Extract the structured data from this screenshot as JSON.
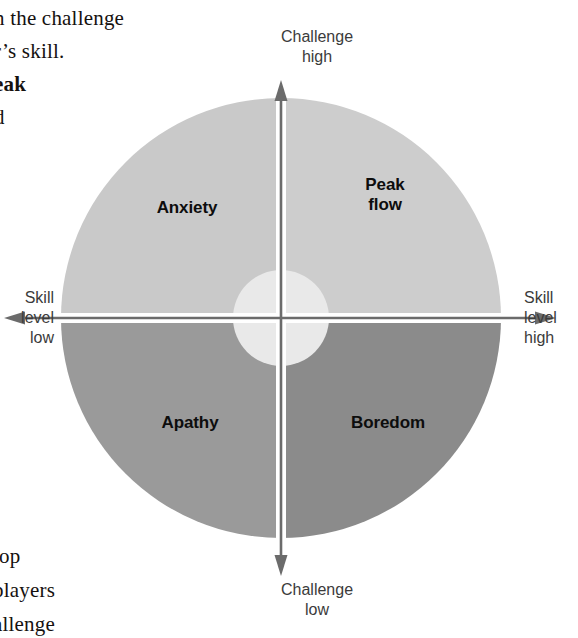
{
  "page": {
    "background_color": "#ffffff",
    "width": 578,
    "height": 638
  },
  "body_text": {
    "top_lines": [
      "n the challenge",
      "r’s  skill.",
      "eak",
      "d"
    ],
    "bottom_lines": [
      "l",
      "top",
      "players",
      "allenge"
    ]
  },
  "diagram": {
    "quadrants": [
      {
        "id": "anxiety",
        "label": "Anxiety",
        "position": "top-left",
        "color": "#c9c9c9"
      },
      {
        "id": "peak-flow",
        "label": "Peak\nflow",
        "label_line1": "Peak",
        "label_line2": "flow",
        "position": "top-right",
        "color": "#cdcdcd"
      },
      {
        "id": "apathy",
        "label": "Apathy",
        "position": "bottom-left",
        "color": "#9a9a9a"
      },
      {
        "id": "boredom",
        "label": "Boredom",
        "position": "bottom-right",
        "color": "#8b8b8b"
      }
    ],
    "center_circle": {
      "color": "#e9e9e9",
      "radius": 48
    },
    "axes": {
      "vertical": {
        "top_label_line1": "Challenge",
        "top_label_line2": "high",
        "bottom_label_line1": "Challenge",
        "bottom_label_line2": "low",
        "color": "#6b6b6b"
      },
      "horizontal": {
        "right_label_line1": "Skill",
        "right_label_line2": "level",
        "right_label_line3": "high",
        "left_label_line1": "Skill",
        "left_label_line2": "level",
        "left_label_line3": "low",
        "color": "#6b6b6b"
      }
    },
    "geometry": {
      "center_x": 281,
      "center_y": 318,
      "radius": 220
    }
  }
}
